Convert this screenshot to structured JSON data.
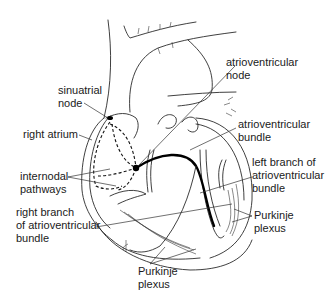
{
  "figure": {
    "stroke_color": "#2a2a2a",
    "background": "#ffffff"
  },
  "labels": {
    "sinuatrial_node": {
      "line1": "sinuatrial",
      "line2": "node"
    },
    "right_atrium": {
      "line1": "right atrium"
    },
    "internodal_pathways": {
      "line1": "internodal",
      "line2": "pathways"
    },
    "right_branch": {
      "line1": "right branch",
      "line2": "of atrioventricular",
      "line3": "bundle"
    },
    "av_node": {
      "line1": "atrioventricular",
      "line2": "node"
    },
    "av_bundle": {
      "line1": "atrioventricular",
      "line2": "bundle"
    },
    "left_branch": {
      "line1": "left branch of",
      "line2": "atrioventricular",
      "line3": "bundle"
    },
    "purkinje_right": {
      "line1": "Purkinje",
      "line2": "plexus"
    },
    "purkinje_bottom": {
      "line1": "Purkinje",
      "line2": "plexus"
    }
  }
}
